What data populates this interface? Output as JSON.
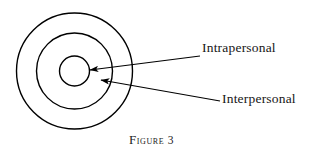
{
  "figure": {
    "caption_lead": "F",
    "caption_rest": "igure",
    "caption_number": "3",
    "caption_full": "Figure 3"
  },
  "diagram": {
    "type": "concentric-circles",
    "background_color": "#ffffff",
    "stroke_color": "#000000",
    "center": {
      "x": 74.5,
      "y": 71
    },
    "circles": [
      {
        "name": "outer-circle",
        "radius": 58,
        "stroke_width": 1.4
      },
      {
        "name": "middle-circle",
        "radius": 38,
        "stroke_width": 1.4
      },
      {
        "name": "inner-circle",
        "radius": 15,
        "stroke_width": 1.4
      }
    ],
    "labels": [
      {
        "id": "intrapersonal",
        "text": "Intrapersonal",
        "target": "inner-circle",
        "arrow": {
          "from_x": 200,
          "from_y": 56,
          "to_x": 90,
          "to_y": 70
        }
      },
      {
        "id": "interpersonal",
        "text": "Interpersonal",
        "target": "middle-circle",
        "arrow": {
          "from_x": 220,
          "from_y": 101,
          "to_x": 101,
          "to_y": 80
        }
      }
    ]
  }
}
